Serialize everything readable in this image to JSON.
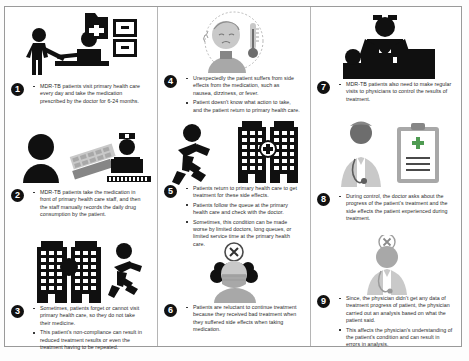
{
  "diagram": {
    "type": "nine-step-process-infographic",
    "columns": 3,
    "accent_colors": {
      "pictogram": "#101010",
      "badge_background": "#111111",
      "badge_text": "#ffffff",
      "cross_green": "#4f9b52",
      "photo_gray": "#a8a8a8",
      "frame_border": "#9a9a9a"
    }
  },
  "steps": [
    {
      "number": "1",
      "icon": "pharmacy-counter-icon",
      "bullets": [
        "MDR-TB patients visit primary health care every day and take the medication prescribed by the doctor for 6-24 months."
      ]
    },
    {
      "number": "2",
      "icon": "patient-pills-nurse-icon",
      "bullets": [
        "MDR-TB patients take the medication in front of primary health care staff, and then the staff manually records the daily drug consumption by the patient."
      ]
    },
    {
      "number": "3",
      "icon": "buildings-running-person-icon",
      "bullets": [
        "Sometimes, patients forget or cannot visit primary health care, so they do not take their medicine.",
        "This patient's non-compliance can result in reduced treatment results or even the treatment having to be repeated."
      ]
    },
    {
      "number": "4",
      "icon": "sick-person-thermometer-icon",
      "bullets": [
        "Unexpectedly the patient suffers from side effects from the medication, such as nausea, dizziness, or fever.",
        "Patient doesn't know what action to take, and the patient return to primary health care."
      ]
    },
    {
      "number": "5",
      "icon": "running-person-clinic-buildings-icon",
      "bullets": [
        "Patients return to primary health care to get treatment for these side effects.",
        "Patients follow the queue at the primary health care and check with the doctor.",
        "Sometimes, this condition can be made worse by limited doctors, long queues, or limited service time at the primary health care."
      ]
    },
    {
      "number": "6",
      "icon": "masked-patient-refusal-icon",
      "bullets": [
        "Patients are reluctant to continue treatment because they received bad treatment when they suffered side effects when taking medication."
      ]
    },
    {
      "number": "7",
      "icon": "doctor-examining-patient-icon",
      "bullets": [
        "MDR-TB patients also need to make regular visits to physicians to control the results of treatment."
      ]
    },
    {
      "number": "8",
      "icon": "doctor-clipboard-icon",
      "bullets": [
        "During control, the doctor asks about the progress of the patient's treatment and the side effects the patient experienced during treatment."
      ]
    },
    {
      "number": "9",
      "icon": "physician-no-data-icon",
      "bullets": [
        "Since, the physician didn't get any data of treatment progress of patient, the physician carried out an analysis based on what the patient said.",
        "This affects the physician's understanding of the patient's condition and can result in errors in analysis."
      ]
    }
  ]
}
